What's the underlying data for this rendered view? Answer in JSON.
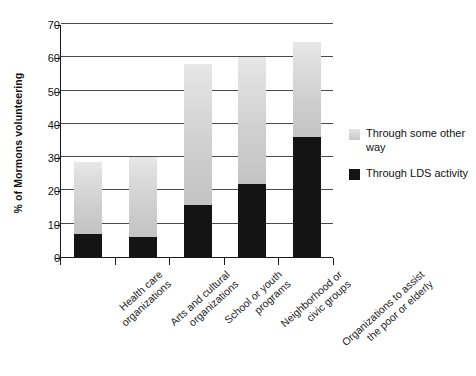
{
  "chart_data": {
    "type": "bar",
    "subtype": "stacked-bar",
    "title": "",
    "xlabel": "",
    "ylabel": "% of Mormons volunteering",
    "ylim": [
      0,
      70
    ],
    "yticks": [
      0,
      10,
      20,
      30,
      40,
      50,
      60,
      70
    ],
    "grid": true,
    "legend_position": "right",
    "categories": [
      "Health care organizations",
      "Arts and cultural organizations",
      "School or youth programs",
      "Neighborhood or civic groups",
      "Organizations to assist the poor or elderly"
    ],
    "category_lines": [
      [
        "Health care",
        "organizations"
      ],
      [
        "Arts and cultural",
        "organizations"
      ],
      [
        "School or youth",
        "programs"
      ],
      [
        "Neighborhood or",
        "civic groups"
      ],
      [
        "Organizations to assist",
        "the poor or elderly"
      ]
    ],
    "series": [
      {
        "name": "Through LDS activity",
        "color": "#141414",
        "values": [
          7,
          6,
          15.5,
          22,
          36
        ]
      },
      {
        "name": "Through some other way",
        "color": "#d4d4d4",
        "values": [
          21.5,
          24,
          42.5,
          38,
          28.5
        ]
      }
    ],
    "totals": [
      28.5,
      30,
      58,
      60,
      64.5
    ]
  },
  "legend": {
    "items": [
      {
        "label": "Through some other way",
        "swatch": "gray-swatch-icon"
      },
      {
        "label": "Through LDS activity",
        "swatch": "black-swatch-icon"
      }
    ]
  },
  "axes": {
    "y_title": "% of Mormons volunteering",
    "y_tick_labels": [
      "70",
      "60",
      "50",
      "40",
      "30",
      "20",
      "10",
      "0"
    ]
  }
}
